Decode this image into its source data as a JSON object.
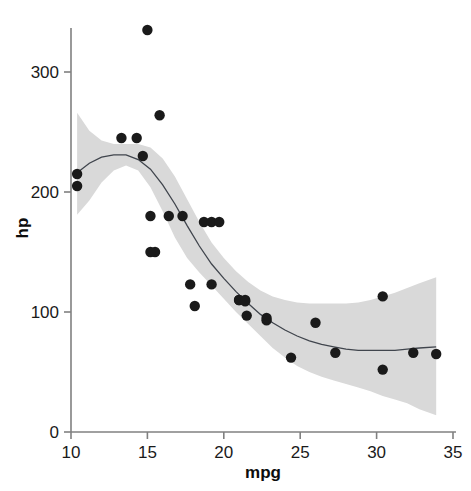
{
  "chart_data": {
    "type": "scatter",
    "title": "",
    "xlabel": "mpg",
    "ylabel": "hp",
    "xlim": [
      9.2,
      35.6
    ],
    "ylim": [
      -12,
      348
    ],
    "xticks": [
      10,
      15,
      20,
      25,
      30,
      35
    ],
    "yticks": [
      0,
      100,
      200,
      300
    ],
    "xtick_labels": [
      "10",
      "15",
      "20",
      "25",
      "30",
      "35"
    ],
    "ytick_labels": [
      "0",
      "100",
      "200",
      "300"
    ],
    "grid": false,
    "legend": "none",
    "point_color": "#1a1a1a",
    "point_size": 5.2,
    "line_color": "#40454d",
    "band_color": "#d9d9d9",
    "axis_color": "#808080",
    "series": [
      {
        "name": "mtcars",
        "x": [
          21.0,
          21.0,
          22.8,
          21.4,
          18.7,
          18.1,
          14.3,
          24.4,
          22.8,
          19.2,
          17.8,
          16.4,
          17.3,
          15.2,
          10.4,
          10.4,
          14.7,
          32.4,
          30.4,
          33.9,
          21.5,
          15.5,
          15.2,
          13.3,
          19.2,
          27.3,
          26.0,
          30.4,
          15.8,
          19.7,
          15.0,
          21.4
        ],
        "y": [
          110,
          110,
          93,
          110,
          175,
          105,
          245,
          62,
          95,
          123,
          123,
          180,
          180,
          180,
          205,
          215,
          230,
          66,
          52,
          65,
          97,
          150,
          150,
          245,
          175,
          66,
          91,
          113,
          264,
          175,
          335,
          109
        ]
      }
    ],
    "smoother": {
      "method": "loess",
      "x": [
        10.4,
        11.2,
        12.0,
        12.8,
        13.6,
        14.4,
        15.2,
        16.0,
        16.8,
        17.6,
        18.4,
        19.2,
        20.0,
        20.8,
        21.6,
        22.4,
        23.2,
        24.0,
        24.8,
        25.6,
        26.4,
        27.2,
        28.0,
        28.8,
        29.6,
        30.4,
        31.2,
        32.0,
        32.8,
        33.9
      ],
      "y": [
        216,
        224,
        229,
        231,
        231,
        227,
        219,
        206,
        190,
        172,
        155,
        140,
        128,
        117,
        107,
        98,
        91,
        85,
        80,
        76,
        73,
        71,
        69,
        68,
        68,
        68,
        68,
        69,
        70,
        71
      ],
      "ci_upper": [
        266,
        251,
        243,
        240,
        240,
        240,
        237,
        228,
        213,
        194,
        175,
        158,
        145,
        134,
        125,
        118,
        113,
        110,
        108,
        107,
        107,
        107,
        107,
        108,
        110,
        113,
        116,
        120,
        124,
        129
      ],
      "ci_lower": [
        181,
        193,
        208,
        218,
        222,
        218,
        204,
        184,
        162,
        145,
        133,
        122,
        111,
        100,
        90,
        80,
        70,
        62,
        55,
        50,
        46,
        43,
        40,
        37,
        34,
        30,
        27,
        24,
        19,
        14
      ]
    }
  }
}
